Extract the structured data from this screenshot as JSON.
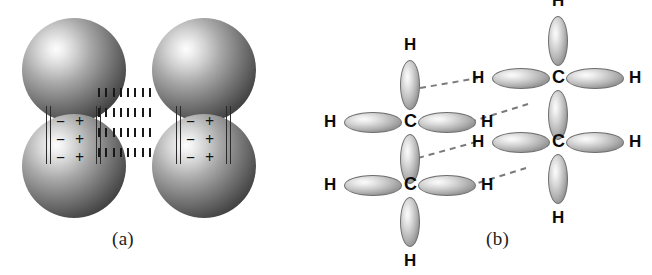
{
  "figure": {
    "background_color": "#ffffff",
    "width": 652,
    "height": 275
  },
  "panels": [
    {
      "id": "a",
      "label": "(a)",
      "caption_label": "(a)",
      "description": "Two diatomic dipolar molecules drawn as pairs of shaded spheres joined by bond rails, with separated negative and positive partial charges; vertical rows of short dashes between the two molecules indicate the dipole-dipole interaction.",
      "molecule_count": 2,
      "sphere_color_light": "#fdfdfd",
      "sphere_color_dark": "#151515",
      "charge_rows": [
        {
          "negative": "−",
          "positive": "+"
        },
        {
          "negative": "−",
          "positive": "+"
        },
        {
          "negative": "−",
          "positive": "+"
        }
      ],
      "interaction_dash_rows": 4,
      "interaction_dashes_per_row": 8
    },
    {
      "id": "b",
      "label": "(b)",
      "caption_label": "(b)",
      "description": "Two hydrocarbon molecules drawn with carbon atoms and four hybrid orbital lobes each; dashed lines between facing hydrogens of the two molecules indicate London dispersion / induced-dipole attraction.",
      "molecule_count": 2,
      "lobe_color_light": "#fbfbfb",
      "lobe_color_dark": "#6e6e6e",
      "lobe_outline_color": "#6d6d6d",
      "carbon_symbol": "C",
      "hydrogen_symbol": "H",
      "interaction_dash_lines": 4,
      "molecules": [
        {
          "name": "left-molecule",
          "carbons": [
            {
              "name": "left-upper-carbon",
              "carbon_label": "C",
              "hydrogens": [
                {
                  "position": "up",
                  "label": "H"
                },
                {
                  "position": "left",
                  "label": "H"
                },
                {
                  "position": "right",
                  "label": "H"
                }
              ]
            },
            {
              "name": "left-lower-carbon",
              "carbon_label": "C",
              "hydrogens": [
                {
                  "position": "down",
                  "label": "H"
                },
                {
                  "position": "left",
                  "label": "H"
                },
                {
                  "position": "right",
                  "label": "H"
                }
              ]
            }
          ]
        },
        {
          "name": "right-molecule",
          "carbons": [
            {
              "name": "right-upper-carbon",
              "carbon_label": "C",
              "hydrogens": [
                {
                  "position": "up",
                  "label": "H"
                },
                {
                  "position": "left",
                  "label": "H"
                },
                {
                  "position": "right",
                  "label": "H"
                }
              ]
            },
            {
              "name": "right-lower-carbon",
              "carbon_label": "C",
              "hydrogens": [
                {
                  "position": "down",
                  "label": "H"
                },
                {
                  "position": "left",
                  "label": "H"
                },
                {
                  "position": "right",
                  "label": "H"
                }
              ]
            }
          ]
        }
      ]
    }
  ],
  "symbols": {
    "negative_charge": "−",
    "positive_charge": "+",
    "carbon": "C",
    "hydrogen": "H"
  }
}
